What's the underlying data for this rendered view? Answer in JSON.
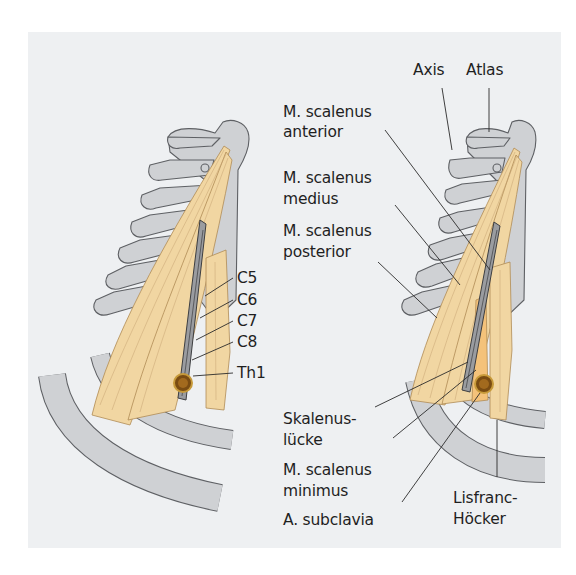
{
  "figure": {
    "background_color": "#eef0f2",
    "bone_color": "#cfd1d4",
    "muscle_color": "#f1d6a2",
    "muscle_minimus_color": "#f4c27a",
    "artery_color": "#7a4c12"
  },
  "left_figure": {
    "labels": {
      "c5": "C5",
      "c6": "C6",
      "c7": "C7",
      "c8": "C8",
      "th1": "Th1"
    }
  },
  "right_figure": {
    "labels": {
      "axis": "Axis",
      "atlas": "Atlas",
      "scalenus_anterior_1": "M. scalenus",
      "scalenus_anterior_2": "anterior",
      "scalenus_medius_1": "M. scalenus",
      "scalenus_medius_2": "medius",
      "scalenus_posterior_1": "M. scalenus",
      "scalenus_posterior_2": "posterior",
      "skalenusluecke_1": "Skalenus-",
      "skalenusluecke_2": "lücke",
      "scalenus_minimus_1": "M. scalenus",
      "scalenus_minimus_2": "minimus",
      "subclavia": "A. subclavia",
      "lisfranc_1": "Lisfranc-",
      "lisfranc_2": "Höcker"
    }
  }
}
